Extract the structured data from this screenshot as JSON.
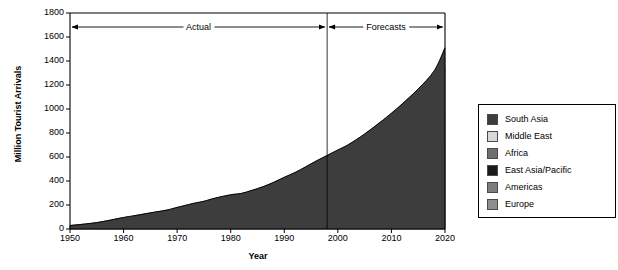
{
  "chart_data": {
    "type": "area",
    "stacked": true,
    "title": "",
    "xlabel": "Year",
    "ylabel": "Million Tourist Arrivals",
    "xlim": [
      1950,
      2020
    ],
    "ylim": [
      0,
      1800
    ],
    "ytick_labels": [
      "0",
      "200",
      "400",
      "600",
      "800",
      "1000",
      "1200",
      "1400",
      "1600",
      "1800"
    ],
    "ytick_values": [
      0,
      200,
      400,
      600,
      800,
      1000,
      1200,
      1400,
      1600,
      1800
    ],
    "xtick_labels": [
      "1950",
      "1960",
      "1970",
      "1980",
      "1990",
      "2000",
      "2010",
      "2020"
    ],
    "xtick_values": [
      1950,
      1960,
      1970,
      1980,
      1990,
      2000,
      2010,
      2020
    ],
    "grid": false,
    "legend_position": "right",
    "x": [
      1950,
      1955,
      1960,
      1962,
      1965,
      1968,
      1970,
      1973,
      1975,
      1977,
      1980,
      1982,
      1984,
      1986,
      1988,
      1990,
      1992,
      1994,
      1996,
      1998,
      2000,
      2002,
      2005,
      2008,
      2010,
      2012,
      2015,
      2018,
      2020
    ],
    "series": [
      {
        "name": "Europe",
        "color": "#8e8e8e",
        "values": [
          20,
          38,
          70,
          80,
          95,
          110,
          125,
          145,
          155,
          170,
          185,
          190,
          205,
          220,
          240,
          265,
          285,
          310,
          335,
          355,
          375,
          395,
          430,
          470,
          500,
          530,
          580,
          640,
          717
        ]
      },
      {
        "name": "Americas",
        "color": "#7d7d7d",
        "values": [
          7,
          12,
          19,
          22,
          27,
          31,
          35,
          41,
          44,
          48,
          53,
          55,
          59,
          64,
          70,
          76,
          83,
          90,
          97,
          105,
          113,
          120,
          134,
          150,
          160,
          172,
          190,
          212,
          231
        ]
      },
      {
        "name": "East Asia/Pacific",
        "color": "#1a1a1a",
        "values": [
          1,
          2,
          4,
          5,
          7,
          9,
          11,
          15,
          18,
          22,
          28,
          31,
          36,
          42,
          50,
          58,
          68,
          80,
          93,
          105,
          117,
          130,
          158,
          190,
          212,
          237,
          278,
          325,
          397
        ]
      },
      {
        "name": "Africa",
        "color": "#6f6f6f",
        "values": [
          0.5,
          1,
          2,
          2.5,
          3.5,
          4.5,
          5.5,
          7,
          8,
          9,
          10,
          11,
          12,
          14,
          15,
          17,
          18,
          20,
          22,
          24,
          27,
          29,
          34,
          40,
          44,
          48,
          55,
          63,
          77
        ]
      },
      {
        "name": "Middle East",
        "color": "#d8d8d8",
        "values": [
          0.2,
          0.4,
          0.8,
          1,
          1.5,
          2,
          2.5,
          3.5,
          4.5,
          5.5,
          7,
          7.5,
          8,
          9,
          10,
          11,
          12,
          13,
          15,
          17,
          19,
          21,
          25,
          30,
          34,
          38,
          45,
          55,
          69
        ]
      },
      {
        "name": "South Asia",
        "color": "#3d3d3d",
        "values": [
          0.1,
          0.2,
          0.3,
          0.4,
          0.6,
          0.8,
          1,
          1.4,
          1.7,
          2,
          2.3,
          2.5,
          2.8,
          3.2,
          3.6,
          4.2,
          4.8,
          5.4,
          6.1,
          7,
          8,
          9,
          11,
          13,
          15,
          17,
          20,
          24,
          19
        ]
      }
    ],
    "annotations": [
      {
        "name": "actual",
        "label": "Actual",
        "from": 1950,
        "to": 1998,
        "style": "double-arrow"
      },
      {
        "name": "forecasts",
        "label": "Forecasts",
        "from": 1998,
        "to": 2020,
        "style": "double-arrow"
      }
    ],
    "divider_x": 1998
  },
  "legend": {
    "items": [
      {
        "label": "South Asia",
        "color": "#3d3d3d"
      },
      {
        "label": "Middle East",
        "color": "#d8d8d8"
      },
      {
        "label": "Africa",
        "color": "#6f6f6f"
      },
      {
        "label": "East Asia/Pacific",
        "color": "#1a1a1a"
      },
      {
        "label": "Americas",
        "color": "#7d7d7d"
      },
      {
        "label": "Europe",
        "color": "#8e8e8e"
      }
    ]
  }
}
